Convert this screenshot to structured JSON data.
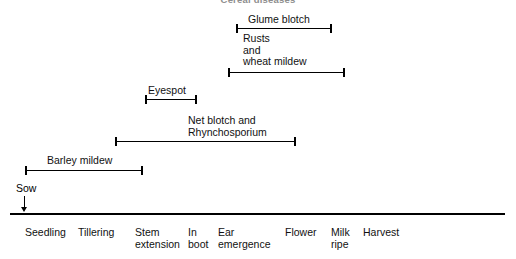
{
  "figure": {
    "title": "Cereal diseases",
    "axis": {
      "name": "growth-stage-axis",
      "x_start": 10,
      "x_end": 505,
      "y": 213
    }
  },
  "sow": {
    "label": "Sow",
    "x": 16,
    "y": 182,
    "arrow_x": 24
  },
  "bands": [
    {
      "name": "glume-blotch",
      "lines": [
        "Glume blotch"
      ],
      "label_x": 248,
      "label_y": 14,
      "bar_x": 236,
      "bar_width": 96,
      "bar_y": 24
    },
    {
      "name": "rusts-and-wheat-mildew",
      "lines": [
        "Rusts",
        "and",
        "wheat mildew"
      ],
      "label_x": 243,
      "label_y": 33,
      "bar_x": 228,
      "bar_width": 117,
      "bar_y": 68
    },
    {
      "name": "eyespot",
      "lines": [
        "Eyespot"
      ],
      "label_x": 148,
      "label_y": 85,
      "bar_x": 145,
      "bar_width": 52,
      "bar_y": 95
    },
    {
      "name": "net-blotch-and-rhynchosporium",
      "lines": [
        "Net blotch and",
        "Rhynchosporium"
      ],
      "label_x": 188,
      "label_y": 115,
      "bar_x": 115,
      "bar_width": 181,
      "bar_y": 137
    },
    {
      "name": "barley-mildew",
      "lines": [
        "Barley mildew"
      ],
      "label_x": 47,
      "label_y": 155,
      "bar_x": 25,
      "bar_width": 118,
      "bar_y": 166
    }
  ],
  "stages": [
    {
      "name": "seedling",
      "lines": [
        "Seedling"
      ],
      "x": 25
    },
    {
      "name": "tillering",
      "lines": [
        "Tillering"
      ],
      "x": 78
    },
    {
      "name": "stem-extension",
      "lines": [
        "Stem",
        "extension"
      ],
      "x": 135
    },
    {
      "name": "in-boot",
      "lines": [
        "In",
        "boot"
      ],
      "x": 188
    },
    {
      "name": "ear-emergence",
      "lines": [
        "Ear",
        "emergence"
      ],
      "x": 218
    },
    {
      "name": "flower",
      "lines": [
        "Flower"
      ],
      "x": 285
    },
    {
      "name": "milk-ripe",
      "lines": [
        "Milk",
        "ripe"
      ],
      "x": 331
    },
    {
      "name": "harvest",
      "lines": [
        "Harvest"
      ],
      "x": 363
    }
  ],
  "stage_label_top": 226
}
